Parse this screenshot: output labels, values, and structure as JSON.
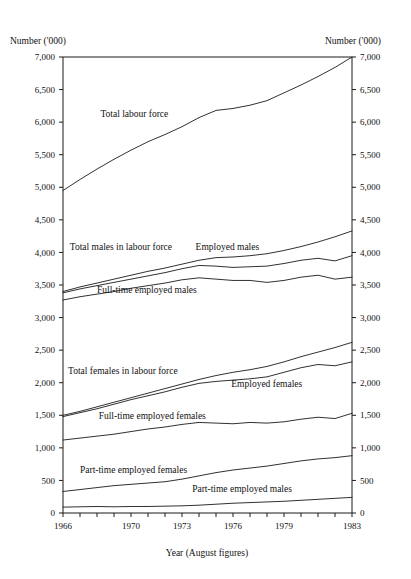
{
  "chart_data": {
    "type": "line",
    "title": "",
    "xlabel": "Year (August figures)",
    "ylabel": "Number ('000)",
    "ylabel_right": "Number ('000)",
    "grid": false,
    "legend": "inline-labels",
    "xlim": [
      1966,
      1983
    ],
    "ylim": [
      0,
      7000
    ],
    "ytick_labels": [
      "7,000",
      "6,500",
      "6,000",
      "5,500",
      "5,000",
      "4,500",
      "4,000",
      "3,500",
      "3,000",
      "2,500",
      "2,000",
      "1,500",
      "1,000",
      "500",
      "0"
    ],
    "ytick_values": [
      7000,
      6500,
      6000,
      5500,
      5000,
      4500,
      4000,
      3500,
      3000,
      2500,
      2000,
      1500,
      1000,
      500,
      0
    ],
    "xtick_labels": [
      "1966",
      "1970",
      "1973",
      "1976",
      "1979",
      "1983"
    ],
    "xtick_values": [
      1966,
      1970,
      1973,
      1976,
      1979,
      1983
    ],
    "x": [
      1966,
      1967,
      1968,
      1969,
      1970,
      1971,
      1972,
      1973,
      1974,
      1975,
      1976,
      1977,
      1978,
      1979,
      1980,
      1981,
      1982,
      1983
    ],
    "series": [
      {
        "name": "Total labour force",
        "values": [
          4950,
          5120,
          5280,
          5430,
          5570,
          5700,
          5810,
          5930,
          6070,
          6180,
          6210,
          6260,
          6330,
          6450,
          6570,
          6700,
          6840,
          7000
        ]
      },
      {
        "name": "Total males in labour force",
        "values": [
          3400,
          3470,
          3530,
          3590,
          3650,
          3710,
          3760,
          3820,
          3880,
          3920,
          3930,
          3950,
          3980,
          4030,
          4090,
          4160,
          4240,
          4330
        ]
      },
      {
        "name": "Employed males",
        "values": [
          3380,
          3440,
          3490,
          3540,
          3590,
          3640,
          3690,
          3750,
          3800,
          3790,
          3770,
          3780,
          3790,
          3830,
          3880,
          3910,
          3870,
          3950
        ]
      },
      {
        "name": "Full-time employed males",
        "values": [
          3270,
          3320,
          3360,
          3400,
          3450,
          3490,
          3530,
          3580,
          3610,
          3590,
          3570,
          3570,
          3540,
          3570,
          3620,
          3650,
          3590,
          3620
        ]
      },
      {
        "name": "Total females in labour force",
        "values": [
          1500,
          1560,
          1630,
          1700,
          1770,
          1840,
          1910,
          1980,
          2050,
          2110,
          2160,
          2200,
          2250,
          2320,
          2400,
          2470,
          2540,
          2620
        ]
      },
      {
        "name": "Employed females",
        "values": [
          1480,
          1540,
          1600,
          1670,
          1740,
          1800,
          1860,
          1930,
          1990,
          2020,
          2040,
          2060,
          2090,
          2160,
          2230,
          2280,
          2260,
          2320
        ]
      },
      {
        "name": "Full-time employed females",
        "values": [
          1120,
          1150,
          1180,
          1210,
          1250,
          1290,
          1320,
          1360,
          1390,
          1380,
          1370,
          1390,
          1380,
          1400,
          1440,
          1470,
          1450,
          1530
        ]
      },
      {
        "name": "Part-time employed females",
        "values": [
          330,
          360,
          390,
          420,
          440,
          460,
          480,
          520,
          570,
          620,
          660,
          690,
          720,
          760,
          800,
          830,
          850,
          880
        ]
      },
      {
        "name": "Part-time employed males",
        "values": [
          90,
          95,
          100,
          95,
          100,
          100,
          105,
          110,
          120,
          135,
          150,
          160,
          170,
          180,
          195,
          210,
          225,
          240
        ]
      }
    ],
    "annotations": [
      {
        "text": "Total labour force",
        "x": 1968.2,
        "y": 6080
      },
      {
        "text": "Total males in labour force",
        "x": 1966.4,
        "y": 4030
      },
      {
        "text": "Employed males",
        "x": 1973.8,
        "y": 4030
      },
      {
        "text": "Full-time employed males",
        "x": 1968.0,
        "y": 3380
      },
      {
        "text": "Total females in labour force",
        "x": 1966.3,
        "y": 2140
      },
      {
        "text": "Employed females",
        "x": 1975.9,
        "y": 1930
      },
      {
        "text": "Full-time employed females",
        "x": 1968.1,
        "y": 1440
      },
      {
        "text": "Part-time employed females",
        "x": 1967.0,
        "y": 620
      },
      {
        "text": "Part-time employed males",
        "x": 1973.6,
        "y": 330
      }
    ]
  }
}
